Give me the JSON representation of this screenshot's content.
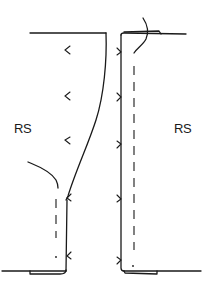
{
  "diagram": {
    "type": "sewing-seam-illustration",
    "labels": {
      "left_panel": "RS",
      "right_panel": "RS"
    },
    "colors": {
      "stroke": "#1a1a1a",
      "background": "#ffffff"
    },
    "elements": [
      "left-fabric-panel-edge",
      "right-fabric-panel-edge",
      "seam-stitching-dashed-lines",
      "notch-marks",
      "hem-fold-tabs",
      "loose-thread-curves"
    ]
  }
}
